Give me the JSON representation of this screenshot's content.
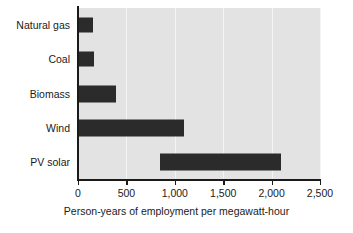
{
  "chart_data": {
    "type": "bar",
    "orientation": "horizontal",
    "title": "",
    "xlabel": "Person-years of employment per megawatt-hour",
    "ylabel": "",
    "categories": [
      "Natural gas",
      "Coal",
      "Biomass",
      "Wind",
      "PV solar"
    ],
    "bars": [
      {
        "category": "Natural gas",
        "start": 0,
        "end": 150,
        "value": 150
      },
      {
        "category": "Coal",
        "start": 0,
        "end": 165,
        "value": 165
      },
      {
        "category": "Biomass",
        "start": 0,
        "end": 395,
        "value": 395
      },
      {
        "category": "Wind",
        "start": 0,
        "end": 1100,
        "value": 1100
      },
      {
        "category": "PV solar",
        "start": 850,
        "end": 2100,
        "value": 2100
      }
    ],
    "values": [
      150,
      165,
      395,
      1100,
      2100
    ],
    "xlim": [
      0,
      2500
    ],
    "xticks": [
      0,
      500,
      1000,
      1500,
      2000,
      2500
    ],
    "xticklabels": [
      "0",
      "500",
      "1,000",
      "1,500",
      "2,000",
      "2,500"
    ],
    "grid": "vertical",
    "legend": "none",
    "bar_color": "#2b2b2b",
    "plot_background": "#e3e3e3",
    "gridline_color": "#f4f4f4",
    "axis_color": "#1a1a1a"
  }
}
